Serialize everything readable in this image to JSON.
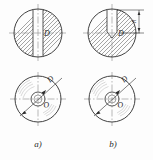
{
  "drawing": {
    "title": "Cross-section and end views of slotted cylindrical part",
    "background_color": "#fdfdfd",
    "line_color": "#2b2b2b",
    "hatch_color": "#555555",
    "centerline_color": "#777777"
  },
  "figures": [
    {
      "id": "fig-a-section",
      "position": "top-left",
      "kind": "cross-section",
      "description": "Circle with 45-degree section hatching and a vertical through-slot",
      "slot_type": "through-slot",
      "diameter_label": "D",
      "has_centerlines": true,
      "hatch_angle_deg": 45
    },
    {
      "id": "fig-b-section",
      "position": "top-right",
      "kind": "cross-section",
      "description": "Circle with 45-degree section hatching and a vertical blind slot with V-shaped bottom",
      "slot_type": "blind-slot-v-bottom",
      "diameter_label": "D",
      "has_centerlines": true,
      "hatch_angle_deg": 45,
      "dimension": {
        "name": "slot-depth",
        "label": "h",
        "orientation": "vertical",
        "side": "right"
      }
    },
    {
      "id": "fig-a-endview",
      "position": "bottom-left",
      "kind": "end-view",
      "description": "End view with outer circle, inner bore circle, crosshair centerlines and leader arrow",
      "leader_label": "D",
      "center_label": "O",
      "has_surface_marks": true
    },
    {
      "id": "fig-b-endview",
      "position": "bottom-right",
      "kind": "end-view",
      "description": "End view with outer circle, inner bore circle, crosshair centerlines and leader arrow",
      "leader_label": "D",
      "center_label": "O",
      "has_surface_marks": true
    }
  ],
  "captions": [
    {
      "id": "caption-a",
      "text": "a)"
    },
    {
      "id": "caption-b",
      "text": "b)"
    }
  ],
  "labels": {
    "diameter": "D",
    "center": "O",
    "depth": "h"
  }
}
